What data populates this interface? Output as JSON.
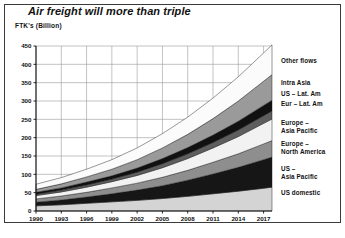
{
  "figure": {
    "title": "Air freight will more than triple",
    "y_axis_label": "FTK's (Billion)"
  },
  "chart_data": {
    "type": "area",
    "title": "Air freight will more than triple",
    "xlabel": "",
    "ylabel": "FTK's (Billion)",
    "stacked": true,
    "grid": true,
    "legend_position": "right",
    "xlim": [
      1990,
      2018
    ],
    "ylim": [
      0,
      450
    ],
    "ytick_labels": [
      "0",
      "50",
      "100",
      "150",
      "200",
      "250",
      "300",
      "350",
      "400",
      "450"
    ],
    "yticks": [
      0,
      50,
      100,
      150,
      200,
      250,
      300,
      350,
      400,
      450
    ],
    "xtick_labels": [
      "1990",
      "1993",
      "1996",
      "1999",
      "2002",
      "2005",
      "2008",
      "2011",
      "2014",
      "2017"
    ],
    "xticks": [
      1990,
      1993,
      1996,
      1999,
      2002,
      2005,
      2008,
      2011,
      2014,
      2017
    ],
    "x": [
      1990,
      1993,
      1996,
      1999,
      2002,
      2005,
      2008,
      2011,
      2014,
      2017,
      2018
    ],
    "series": [
      {
        "name": "US domestic",
        "color": "#d4d4d4",
        "values": [
          14,
          17,
          21,
          25,
          29,
          34,
          40,
          47,
          54,
          62,
          65
        ]
      },
      {
        "name": "US – Asia Pacific",
        "color": "#161616",
        "values": [
          10,
          13,
          17,
          22,
          28,
          35,
          44,
          54,
          65,
          78,
          82
        ]
      },
      {
        "name": "Europe – North America",
        "color": "#8e8e8e",
        "values": [
          9,
          11,
          13,
          16,
          19,
          23,
          27,
          32,
          37,
          43,
          45
        ]
      },
      {
        "name": "Europe – Asia Pacific",
        "color": "#f2f2f2",
        "values": [
          9,
          11,
          14,
          17,
          21,
          26,
          32,
          39,
          47,
          56,
          59
        ]
      },
      {
        "name": "Eur – Lat. Am",
        "color": "#5e5e5e",
        "values": [
          4,
          5,
          6,
          7,
          9,
          11,
          13,
          15,
          18,
          21,
          22
        ]
      },
      {
        "name": "US – Lat. Am",
        "color": "#111111",
        "values": [
          5,
          6,
          8,
          9,
          11,
          14,
          17,
          20,
          24,
          28,
          29
        ]
      },
      {
        "name": "Intra Asia",
        "color": "#9a9a9a",
        "values": [
          8,
          11,
          14,
          18,
          23,
          29,
          36,
          45,
          55,
          66,
          70
        ]
      },
      {
        "name": "Other flows",
        "color": "#fbfbfb",
        "values": [
          14,
          17,
          21,
          26,
          32,
          39,
          47,
          56,
          66,
          77,
          81
        ]
      }
    ],
    "totals": [
      73,
      91,
      114,
      140,
      172,
      211,
      256,
      308,
      366,
      431,
      453
    ]
  },
  "legend": {
    "items": [
      {
        "label": "Other flows"
      },
      {
        "label": "Intra Asia"
      },
      {
        "label": "US – Lat. Am"
      },
      {
        "label": "Eur – Lat. Am"
      },
      {
        "label": "Europe –\nAsia Pacific"
      },
      {
        "label": "Europe –\nNorth America"
      },
      {
        "label": "US –\nAsia Pacific"
      },
      {
        "label": "US domestic"
      }
    ]
  }
}
